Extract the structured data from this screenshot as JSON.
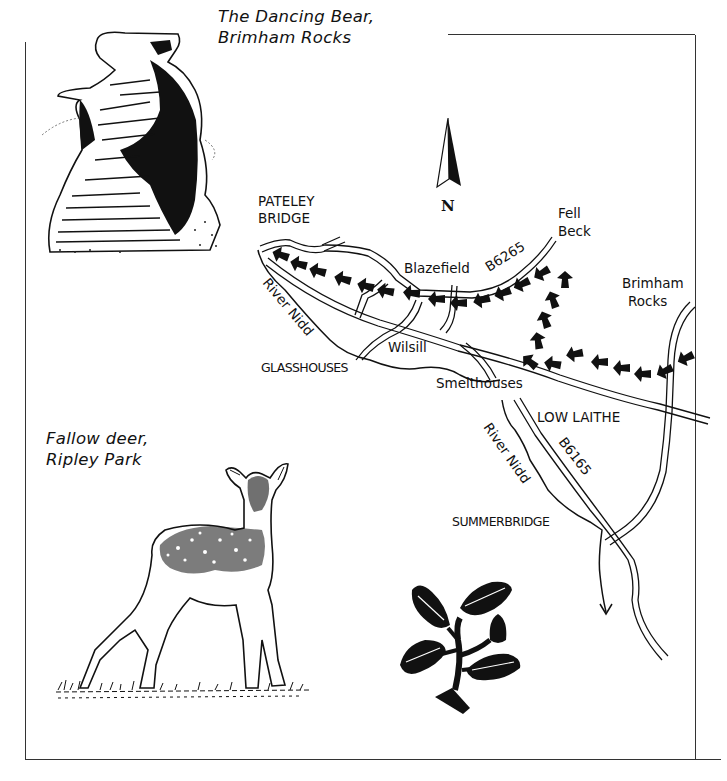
{
  "captions": {
    "bear_line1": "The Dancing Bear,",
    "bear_line2": "Brimham Rocks",
    "deer_line1": "Fallow deer,",
    "deer_line2": "Ripley Park"
  },
  "compass": {
    "label": "N"
  },
  "places": {
    "pateley_line1": "PATELEY",
    "pateley_line2": "BRIDGE",
    "fell_beck_line1": "Fell",
    "fell_beck_line2": "Beck",
    "blazefield": "Blazefield",
    "b6265": "B6265",
    "brimham_line1": "Brimham",
    "brimham_line2": "Rocks",
    "river_nidd_upper": "River Nidd",
    "wilsill": "Wilsill",
    "glasshouses": "GLASSHOUSES",
    "smelthouses": "Smelthouses",
    "low_laithe": "LOW LAITHE",
    "river_nidd_lower": "River Nidd",
    "b6165": "B6165",
    "summerbridge": "SUMMERBRIDGE"
  },
  "illustrations": {
    "bear": "dancing-bear-rock",
    "deer": "fallow-deer",
    "leaf": "oak-sprig"
  },
  "colors": {
    "ink": "#111111",
    "paper": "#ffffff",
    "frame": "#333333"
  }
}
